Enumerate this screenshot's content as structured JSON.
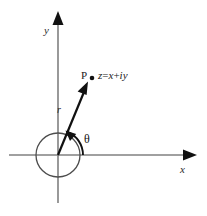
{
  "figure": {
    "background_color": "#ffffff",
    "width": 207,
    "height": 216
  },
  "colors": {
    "axis": "#808080",
    "vector": "#111111",
    "circle": "#4d4d4d",
    "arc": "#111111",
    "text": "#1a1a1a"
  },
  "axes": {
    "x_label": "x",
    "y_label": "y",
    "origin": {
      "x": 58,
      "y": 155
    },
    "x_range": [
      9,
      196
    ],
    "y_range": [
      13,
      203
    ]
  },
  "labels": {
    "point_name": "P",
    "expression_z": "z",
    "expression_eq": "=",
    "expression_x": "x",
    "expression_plus": "+",
    "expression_iy": "iy",
    "expression_full": "z = x + iy",
    "radius": "r",
    "angle": "θ"
  },
  "geometry": {
    "unit_circle_radius": 22,
    "vector_tip": {
      "x": 88,
      "y": 82
    },
    "point_marker": {
      "x": 92,
      "y": 78
    },
    "angle_arc_radius": 25,
    "angle_degrees": 68
  }
}
